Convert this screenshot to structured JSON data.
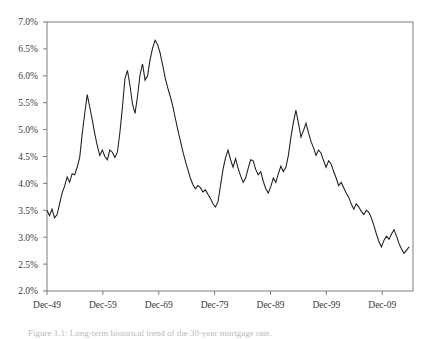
{
  "chart_data": {
    "type": "line",
    "title": "",
    "subtitle": "",
    "xlabel": "",
    "ylabel": "",
    "ylim": [
      2.0,
      7.0
    ],
    "ytick_values": [
      2.0,
      2.5,
      3.0,
      3.5,
      4.0,
      4.5,
      5.0,
      5.5,
      6.0,
      6.5,
      7.0
    ],
    "ytick_labels": [
      "2.0%",
      "2.5%",
      "3.0%",
      "3.5%",
      "4.0%",
      "4.5%",
      "5.0%",
      "5.5%",
      "6.0%",
      "6.5%",
      "7.0%"
    ],
    "xtick_labels": [
      "Dec-49",
      "Dec-59",
      "Dec-69",
      "Dec-79",
      "Dec-89",
      "Dec-99",
      "Dec-09"
    ],
    "xtick_positions": [
      0,
      10,
      20,
      30,
      40,
      50,
      60
    ],
    "xlim": [
      0,
      65.5
    ],
    "grid": false,
    "legend": null,
    "legend_position": "none",
    "series": [
      {
        "name": "rate",
        "color": "#1c1c1c",
        "x": [
          0.0,
          0.45,
          0.9,
          1.35,
          1.8,
          2.25,
          2.7,
          3.15,
          3.6,
          4.05,
          4.5,
          4.95,
          5.4,
          5.85,
          6.3,
          6.75,
          7.2,
          7.65,
          8.1,
          8.55,
          9.0,
          9.45,
          9.9,
          10.35,
          10.8,
          11.25,
          11.7,
          12.15,
          12.6,
          13.05,
          13.5,
          13.95,
          14.4,
          14.85,
          15.3,
          15.75,
          16.2,
          16.65,
          17.1,
          17.55,
          18.0,
          18.45,
          18.9,
          19.35,
          19.8,
          20.25,
          20.7,
          21.15,
          21.6,
          22.05,
          22.5,
          22.95,
          23.4,
          23.85,
          24.3,
          24.75,
          25.2,
          25.65,
          26.1,
          26.55,
          27.0,
          27.45,
          27.9,
          28.35,
          28.8,
          29.25,
          29.7,
          30.15,
          30.6,
          31.05,
          31.5,
          31.95,
          32.4,
          32.85,
          33.3,
          33.75,
          34.2,
          34.65,
          35.1,
          35.55,
          36.0,
          36.45,
          36.9,
          37.35,
          37.8,
          38.25,
          38.7,
          39.15,
          39.6,
          40.05,
          40.5,
          40.95,
          41.4,
          41.85,
          42.3,
          42.75,
          43.2,
          43.65,
          44.1,
          44.55,
          45.0,
          45.45,
          45.9,
          46.35,
          46.8,
          47.25,
          47.7,
          48.15,
          48.6,
          49.05,
          49.5,
          49.95,
          50.4,
          50.85,
          51.3,
          51.75,
          52.2,
          52.65,
          53.1,
          53.55,
          54.0,
          54.45,
          54.9,
          55.35,
          55.8,
          56.25,
          56.7,
          57.15,
          57.6,
          58.05,
          58.5,
          58.95,
          59.4,
          59.85,
          60.3,
          60.75,
          61.2,
          61.65,
          62.1,
          62.55,
          63.0,
          63.45,
          63.9,
          64.35,
          64.8
        ],
        "y": [
          3.5,
          3.4,
          3.52,
          3.36,
          3.42,
          3.62,
          3.82,
          3.95,
          4.12,
          4.02,
          4.18,
          4.16,
          4.3,
          4.48,
          4.92,
          5.3,
          5.65,
          5.42,
          5.18,
          4.92,
          4.7,
          4.52,
          4.62,
          4.5,
          4.44,
          4.62,
          4.58,
          4.48,
          4.58,
          4.95,
          5.42,
          5.95,
          6.1,
          5.82,
          5.48,
          5.3,
          5.62,
          6.02,
          6.22,
          5.92,
          6.0,
          6.3,
          6.52,
          6.66,
          6.58,
          6.42,
          6.2,
          5.96,
          5.78,
          5.62,
          5.44,
          5.22,
          5.0,
          4.8,
          4.6,
          4.42,
          4.26,
          4.1,
          3.98,
          3.9,
          3.96,
          3.92,
          3.84,
          3.88,
          3.8,
          3.72,
          3.62,
          3.56,
          3.66,
          3.96,
          4.26,
          4.48,
          4.62,
          4.44,
          4.3,
          4.46,
          4.28,
          4.14,
          4.02,
          4.1,
          4.28,
          4.44,
          4.42,
          4.26,
          4.16,
          4.22,
          4.04,
          3.9,
          3.82,
          3.94,
          4.1,
          4.02,
          4.18,
          4.32,
          4.22,
          4.3,
          4.52,
          4.86,
          5.14,
          5.36,
          5.12,
          4.86,
          4.98,
          5.12,
          4.94,
          4.78,
          4.66,
          4.52,
          4.62,
          4.56,
          4.42,
          4.3,
          4.42,
          4.36,
          4.22,
          4.1,
          3.96,
          4.02,
          3.92,
          3.82,
          3.74,
          3.62,
          3.52,
          3.62,
          3.56,
          3.48,
          3.42,
          3.5,
          3.46,
          3.36,
          3.22,
          3.06,
          2.92,
          2.82,
          2.94,
          3.02,
          2.96,
          3.06,
          3.14,
          3.02,
          2.88,
          2.78,
          2.7,
          2.76,
          2.82
        ]
      }
    ]
  },
  "caption": {
    "text": "Figure 1.1: Long-term historical trend of the 30-year mortgage rate."
  }
}
